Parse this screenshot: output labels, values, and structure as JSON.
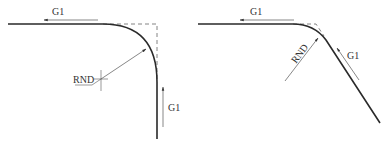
{
  "colors": {
    "background": "#ffffff",
    "contour": "#2a2a2a",
    "dim_line": "#555555",
    "dashed": "#777777",
    "text": "#333333"
  },
  "left_diagram": {
    "description": "Rounded 90-degree corner between horizontal and vertical G1 moves",
    "top_arrow_label": "G1",
    "radius_label": "RND",
    "side_arrow_label": "G1"
  },
  "right_diagram": {
    "description": "Rounded obtuse corner between horizontal and diagonal G1 moves",
    "top_arrow_label": "G1",
    "radius_label": "RND",
    "side_arrow_label": "G1"
  }
}
